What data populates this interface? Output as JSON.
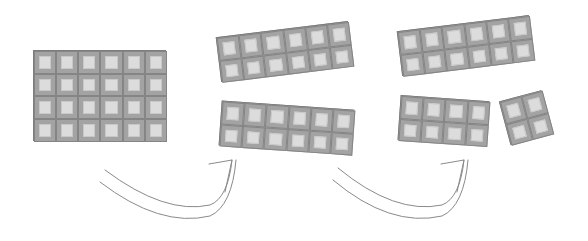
{
  "diagram": {
    "cell_size": 22,
    "colors": {
      "bar_frame": "#8f8f8f",
      "cell_frame": "#a3a3a3",
      "cell_fill": "#dcdcdc",
      "arrow": "#8a8a8a",
      "background": "#ffffff"
    },
    "pieces": [
      {
        "id": "full-bar",
        "stage": 1,
        "rows": 4,
        "cols": 6,
        "cx": 99.5,
        "cy": 95.5,
        "rotate": 0
      },
      {
        "id": "half-top",
        "stage": 2,
        "rows": 2,
        "cols": 6,
        "cx": 285,
        "cy": 52,
        "rotate": -7
      },
      {
        "id": "half-bottom",
        "stage": 2,
        "rows": 2,
        "cols": 6,
        "cx": 287,
        "cy": 128,
        "rotate": 4
      },
      {
        "id": "half-top-kept",
        "stage": 3,
        "rows": 2,
        "cols": 6,
        "cx": 466,
        "cy": 46,
        "rotate": -7
      },
      {
        "id": "piece-2x4",
        "stage": 3,
        "rows": 2,
        "cols": 4,
        "cx": 443,
        "cy": 121,
        "rotate": 4
      },
      {
        "id": "piece-2x2",
        "stage": 3,
        "rows": 2,
        "cols": 2,
        "cx": 526,
        "cy": 118,
        "rotate": -15
      }
    ],
    "arrows": [
      {
        "id": "arrow-step-1",
        "from": "stage-1",
        "to": "stage-2",
        "outer": "M 105 170 Q 165 215 210 205 Q 228 198 232 160",
        "inner": "M 100 182 Q 160 228 210 216 Q 232 206 236 160",
        "head": "M 209 164 L 232 160 L 225 192"
      },
      {
        "id": "arrow-step-2",
        "from": "stage-2",
        "to": "stage-3",
        "outer": "M 338 168 Q 395 215 442 205 Q 460 198 464 160",
        "inner": "M 333 180 Q 390 228 442 216 Q 464 206 468 160",
        "head": "M 441 164 L 464 160 L 457 192"
      }
    ]
  }
}
